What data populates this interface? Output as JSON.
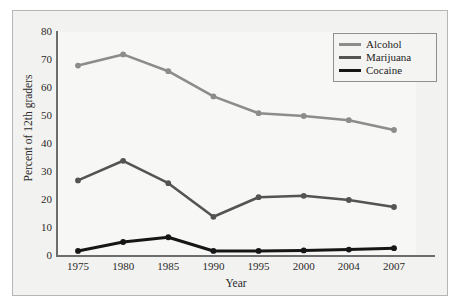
{
  "chart_data": {
    "type": "line",
    "title": "",
    "xlabel": "Year",
    "ylabel": "Percent of 12th graders",
    "categories": [
      "1975",
      "1980",
      "1985",
      "1990",
      "1995",
      "2000",
      "2004",
      "2007"
    ],
    "ylim": [
      0,
      80
    ],
    "yticks": [
      0,
      10,
      20,
      30,
      40,
      50,
      60,
      70,
      80
    ],
    "ytick_labels": [
      "0",
      "10",
      "20",
      "30",
      "40",
      "50",
      "60",
      "70",
      "80"
    ],
    "grid": false,
    "legend_position": "top-right",
    "series": [
      {
        "name": "Alcohol",
        "color": "#8c8c8c",
        "values": [
          68,
          72,
          66,
          57,
          51,
          50,
          48.5,
          45
        ]
      },
      {
        "name": "Marijuana",
        "color": "#545454",
        "values": [
          27,
          34,
          26,
          14,
          21,
          21.5,
          20,
          17.5
        ]
      },
      {
        "name": "Cocaine",
        "color": "#161616",
        "values": [
          1.8,
          5,
          6.7,
          1.8,
          1.8,
          2,
          2.3,
          2.8
        ]
      }
    ]
  },
  "legend": {
    "entries": [
      {
        "label": "Alcohol"
      },
      {
        "label": "Marijuana"
      },
      {
        "label": "Cocaine"
      }
    ]
  },
  "colors": {
    "frame_border": "#b6b6b6",
    "plot_background": "#f7f7f5",
    "figure_background": "#f2f2f0",
    "axis": "#6d6d6d",
    "text": "#2b2b2b"
  }
}
